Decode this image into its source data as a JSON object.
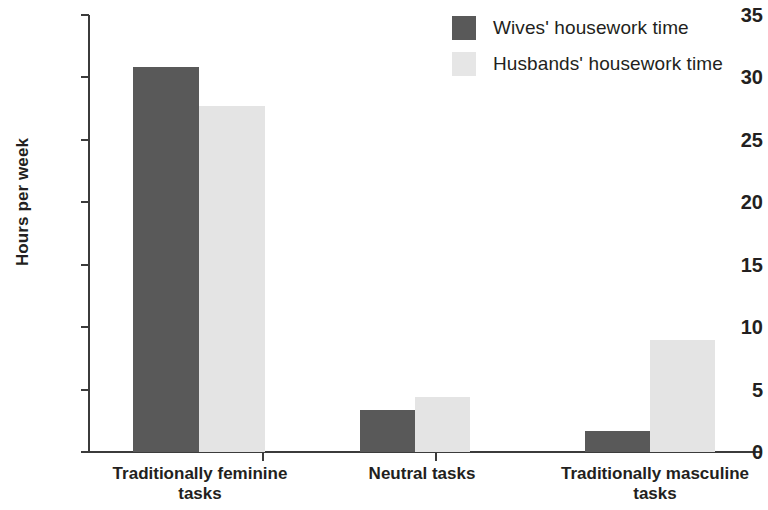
{
  "chart_data": {
    "type": "bar",
    "title": "",
    "subtitle": "",
    "xlabel": "",
    "ylabel": "Hours per week",
    "ylim": [
      0,
      35
    ],
    "ytick_step": 5,
    "ytick_labels": [
      "0",
      "5",
      "10",
      "15",
      "20",
      "25",
      "30",
      "35"
    ],
    "ytick_values": [
      0,
      5,
      10,
      15,
      20,
      25,
      30,
      35
    ],
    "grid": false,
    "legend_position": "top-right",
    "categories": [
      "Traditionally feminine tasks",
      "Neutral tasks",
      "Traditionally masculine tasks"
    ],
    "category_lines": [
      [
        "Traditionally feminine",
        "tasks"
      ],
      [
        "Neutral tasks"
      ],
      [
        "Traditionally masculine",
        "tasks"
      ]
    ],
    "series": [
      {
        "name": "Wives' housework time",
        "color": "#595959",
        "values": [
          30.8,
          3.4,
          1.7
        ]
      },
      {
        "name": "Husbands' housework time",
        "color": "#e4e4e4",
        "values": [
          27.7,
          4.4,
          9.0
        ]
      }
    ]
  },
  "legend": {
    "items": [
      {
        "label": "Wives' housework time",
        "swatch": "series-wives"
      },
      {
        "label": "Husbands' housework time",
        "swatch": "series-husbands"
      }
    ]
  },
  "axes": {
    "y_title": "Hours per week"
  }
}
